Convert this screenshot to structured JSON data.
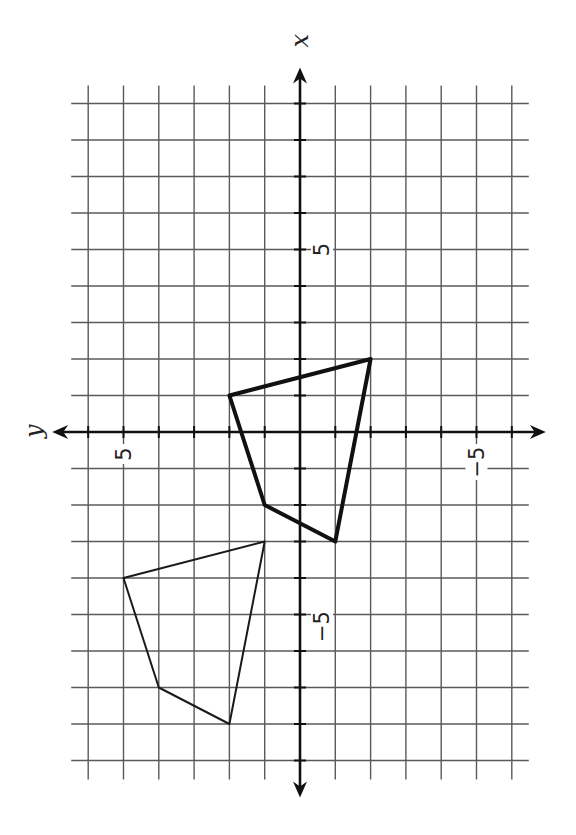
{
  "figure": {
    "orientation": "x-axis up, y-axis left",
    "axes": {
      "x_label": "x",
      "y_label": "y",
      "x_tick_labels": [
        {
          "value": 5,
          "text": "5"
        },
        {
          "value": -5,
          "text": "−5"
        }
      ],
      "y_tick_labels": [
        {
          "value": 5,
          "text": "5"
        },
        {
          "value": -5,
          "text": "−5"
        }
      ],
      "x_range": [
        -9,
        9
      ],
      "y_range": [
        -6,
        6
      ]
    },
    "grid": {
      "origin_px": [
        300,
        432
      ],
      "unit_px_x_axis": 36.5,
      "unit_px_y_axis": 35.3,
      "x_lines": [
        -9,
        -8,
        -7,
        -6,
        -5,
        -4,
        -3,
        -2,
        -1,
        0,
        1,
        2,
        3,
        4,
        5,
        6,
        7,
        8,
        9
      ],
      "y_lines": [
        -6,
        -5,
        -4,
        -3,
        -2,
        -1,
        0,
        1,
        2,
        3,
        4,
        5,
        6
      ]
    },
    "colors": {
      "grid": "#5a5a5a",
      "axis": "#111111",
      "shape": "#111111",
      "background": "#ffffff"
    }
  },
  "chart_data": {
    "type": "scatter",
    "title": "",
    "xlabel": "x",
    "ylabel": "y",
    "grid": true,
    "series": [
      {
        "name": "original (bold)",
        "closed_polygon": true,
        "points": [
          [
            2,
            -2
          ],
          [
            1,
            2
          ],
          [
            -2,
            1
          ],
          [
            -3,
            -1
          ]
        ]
      },
      {
        "name": "image (thin)",
        "closed_polygon": true,
        "points": [
          [
            -3,
            1
          ],
          [
            -4,
            5
          ],
          [
            -7,
            4
          ],
          [
            -8,
            2
          ]
        ]
      }
    ],
    "translation": [
      -5,
      3
    ],
    "xlim": [
      -9,
      9
    ],
    "ylim": [
      -6,
      6
    ]
  }
}
